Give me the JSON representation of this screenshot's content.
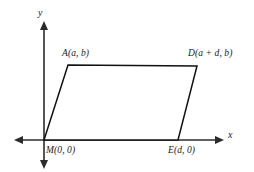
{
  "figure": {
    "background_color": "#ffffff",
    "line_color": "#111111",
    "axis_color": "#2b2b2b"
  },
  "axes": {
    "x_label": "x",
    "y_label": "y",
    "x_axis_name": "x-axis",
    "y_axis_name": "y-axis",
    "origin_x": 44,
    "origin_y": 140
  },
  "vertices": [
    {
      "id": "A",
      "label": "A(a, b)",
      "point_x": 68,
      "point_y": 65
    },
    {
      "id": "D",
      "label": "D(a + d, b)",
      "point_x": 197,
      "point_y": 66
    },
    {
      "id": "M",
      "label": "M(0, 0)",
      "point_x": 44,
      "point_y": 140
    },
    {
      "id": "E",
      "label": "E(d, 0)",
      "point_x": 178,
      "point_y": 140
    }
  ],
  "shape": {
    "name": "parallelogram",
    "path": "M 44,140 L 68,65 L 197,66 L 178,140 Z",
    "fill": "#ffffff",
    "stroke": "#111111"
  },
  "chart_data": {
    "type": "scatter",
    "xlabel": "x",
    "ylabel": "y",
    "grid": false,
    "legend": "none",
    "annotations": [
      "A(a, b)",
      "D(a + d, b)",
      "M(0, 0)",
      "E(d, 0)"
    ],
    "points": [
      {
        "name": "M",
        "label": "M(0, 0)",
        "x": "0",
        "y": "0"
      },
      {
        "name": "E",
        "label": "E(d, 0)",
        "x": "d",
        "y": "0"
      },
      {
        "name": "D",
        "label": "D(a + d, b)",
        "x": "a + d",
        "y": "b"
      },
      {
        "name": "A",
        "label": "A(a, b)",
        "x": "a",
        "y": "b"
      }
    ],
    "edges": [
      {
        "from": "M",
        "to": "A"
      },
      {
        "from": "A",
        "to": "D"
      },
      {
        "from": "D",
        "to": "E"
      },
      {
        "from": "E",
        "to": "M"
      }
    ]
  }
}
